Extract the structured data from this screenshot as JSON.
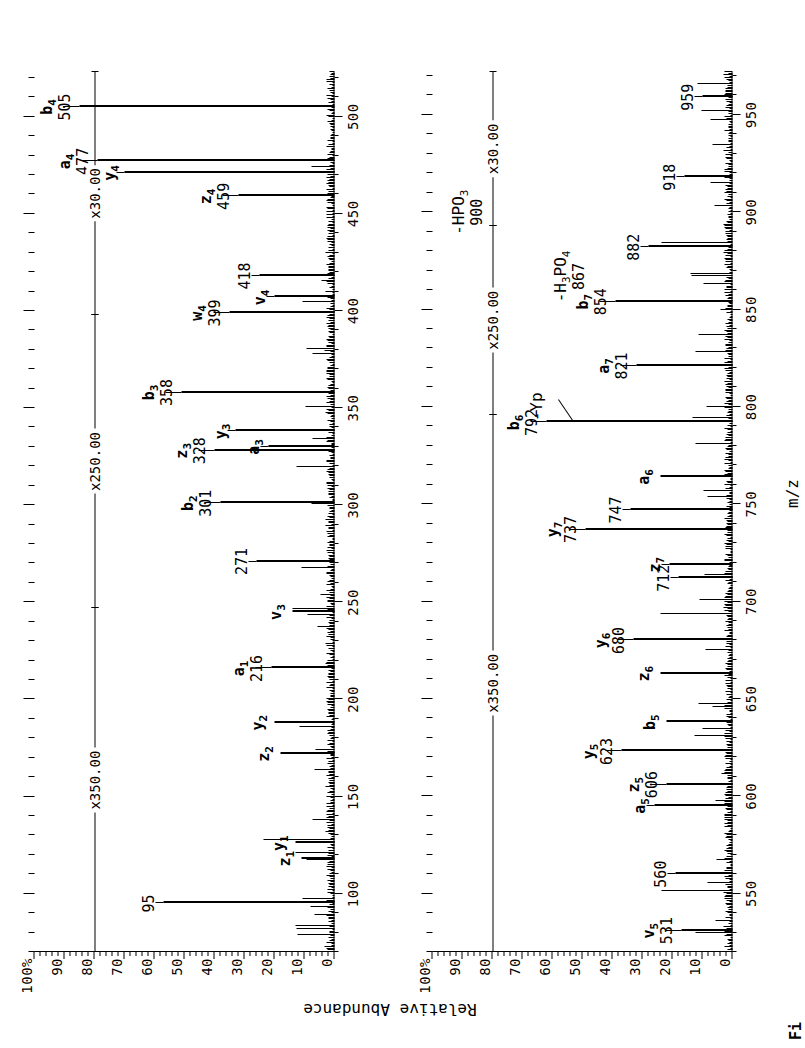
{
  "figure": {
    "caption": "Fi",
    "y_axis_label": "Relative Abundance",
    "x_axis_label": "m/z",
    "y_ticks": [
      "0",
      "10",
      "20",
      "30",
      "40",
      "50",
      "60",
      "70",
      "80",
      "90",
      "100"
    ],
    "y_percent_suffix": "%"
  },
  "chart_data": {
    "type": "line",
    "title": "",
    "xlabel": "m/z",
    "ylabel": "Relative Abundance",
    "panels": [
      {
        "name": "upper-spectrum",
        "xlim": [
          70,
          523
        ],
        "ylim": [
          0,
          100
        ],
        "x_ticks": [
          100,
          150,
          200,
          250,
          300,
          350,
          400,
          450,
          500
        ],
        "y_ticks": [
          0,
          10,
          20,
          30,
          40,
          50,
          60,
          70,
          80,
          90,
          100
        ],
        "magnifications": [
          {
            "label": "x350.00",
            "from": 70,
            "to": 247
          },
          {
            "label": "x250.00",
            "from": 247,
            "to": 398
          },
          {
            "label": "x30.00",
            "from": 398,
            "to": 523
          }
        ],
        "labeled_peaks": [
          {
            "ion": "z",
            "sub": "1",
            "mz": "",
            "x": 118,
            "y": 11,
            "leader": "none"
          },
          {
            "ion": "y",
            "sub": "1",
            "mz": "",
            "x": 126,
            "y": 13,
            "leader": "none"
          },
          {
            "ion": "",
            "sub": "",
            "mz": "95",
            "x": 95,
            "y": 57,
            "leader": "left"
          },
          {
            "ion": "z",
            "sub": "2",
            "mz": "",
            "x": 172,
            "y": 18,
            "leader": "none"
          },
          {
            "ion": "y",
            "sub": "2",
            "mz": "",
            "x": 188,
            "y": 20,
            "leader": "none"
          },
          {
            "ion": "a",
            "sub": "1",
            "mz": "216",
            "x": 216,
            "y": 21,
            "leader": "left"
          },
          {
            "ion": "v",
            "sub": "3",
            "mz": "",
            "x": 245,
            "y": 14,
            "leader": "none"
          },
          {
            "ion": "",
            "sub": "",
            "mz": "271",
            "x": 271,
            "y": 26,
            "leader": "left"
          },
          {
            "ion": "b",
            "sub": "2",
            "mz": "301",
            "x": 301,
            "y": 38,
            "leader": "left"
          },
          {
            "ion": "z",
            "sub": "3",
            "mz": "328",
            "x": 328,
            "y": 40,
            "leader": "left"
          },
          {
            "ion": "y",
            "sub": "3",
            "mz": "",
            "x": 338,
            "y": 33,
            "leader": "left"
          },
          {
            "ion": "a",
            "sub": "3",
            "mz": "",
            "x": 330,
            "y": 22,
            "leader": "diag"
          },
          {
            "ion": "b",
            "sub": "3",
            "mz": "358",
            "x": 358,
            "y": 51,
            "leader": "left"
          },
          {
            "ion": "w",
            "sub": "4",
            "mz": "399",
            "x": 399,
            "y": 35,
            "leader": "left"
          },
          {
            "ion": "v",
            "sub": "4",
            "mz": "",
            "x": 407,
            "y": 20,
            "leader": "diag"
          },
          {
            "ion": "",
            "sub": "",
            "mz": "418",
            "x": 418,
            "y": 25,
            "leader": "left"
          },
          {
            "ion": "z",
            "sub": "4",
            "mz": "459",
            "x": 459,
            "y": 32,
            "leader": "left"
          },
          {
            "ion": "y",
            "sub": "4",
            "mz": "",
            "x": 471,
            "y": 70,
            "leader": "diag"
          },
          {
            "ion": "a",
            "sub": "4",
            "mz": "477",
            "x": 477,
            "y": 79,
            "leader": "left"
          },
          {
            "ion": "b",
            "sub": "4",
            "mz": "505",
            "x": 505,
            "y": 85,
            "leader": "left"
          }
        ]
      },
      {
        "name": "lower-spectrum",
        "xlim": [
          520,
          972
        ],
        "ylim": [
          0,
          100
        ],
        "x_ticks": [
          550,
          600,
          650,
          700,
          750,
          800,
          850,
          900,
          950
        ],
        "y_ticks": [
          0,
          10,
          20,
          30,
          40,
          50,
          60,
          70,
          80,
          90,
          100
        ],
        "magnifications": [
          {
            "label": "x350.00",
            "from": 520,
            "to": 796
          },
          {
            "label": "x250.00",
            "from": 796,
            "to": 893
          },
          {
            "label": "x30.00",
            "from": 893,
            "to": 972
          }
        ],
        "labeled_peaks": [
          {
            "ion": "v",
            "sub": "5",
            "mz": "531",
            "x": 531,
            "y": 17,
            "leader": "left"
          },
          {
            "ion": "",
            "sub": "",
            "mz": "560",
            "x": 560,
            "y": 19,
            "leader": "left"
          },
          {
            "ion": "a",
            "sub": "5",
            "mz": "",
            "x": 595,
            "y": 26,
            "leader": "diag"
          },
          {
            "ion": "z",
            "sub": "5",
            "mz": "606",
            "x": 606,
            "y": 22,
            "leader": "diag"
          },
          {
            "ion": "y",
            "sub": "5",
            "mz": "623",
            "x": 623,
            "y": 37,
            "leader": "left"
          },
          {
            "ion": "b",
            "sub": "5",
            "mz": "",
            "x": 638,
            "y": 22,
            "leader": "none"
          },
          {
            "ion": "z",
            "sub": "6",
            "mz": "",
            "x": 663,
            "y": 24,
            "leader": "none"
          },
          {
            "ion": "y",
            "sub": "6",
            "mz": "680",
            "x": 680,
            "y": 33,
            "leader": "left"
          },
          {
            "ion": "z",
            "sub": "7",
            "mz": "",
            "x": 719,
            "y": 21,
            "leader": "diag"
          },
          {
            "ion": "",
            "sub": "",
            "mz": "712",
            "x": 712,
            "y": 18,
            "leader": "left"
          },
          {
            "ion": "y",
            "sub": "7",
            "mz": "737",
            "x": 737,
            "y": 49,
            "leader": "left"
          },
          {
            "ion": "",
            "sub": "",
            "mz": "747",
            "x": 747,
            "y": 34,
            "leader": "left"
          },
          {
            "ion": "a",
            "sub": "6",
            "mz": "",
            "x": 764,
            "y": 24,
            "leader": "none"
          },
          {
            "ion": "b",
            "sub": "6",
            "mz": "792",
            "x": 792,
            "y": 62,
            "leader": "left"
          },
          {
            "ion": "a",
            "sub": "7",
            "mz": "821",
            "x": 821,
            "y": 32,
            "leader": "left"
          },
          {
            "ion": "b",
            "sub": "7",
            "mz": "854",
            "x": 854,
            "y": 39,
            "leader": "left"
          },
          {
            "ion": "",
            "sub": "",
            "mz": "882",
            "x": 882,
            "y": 28,
            "leader": "left"
          },
          {
            "ion": "",
            "sub": "",
            "mz": "918",
            "x": 918,
            "y": 16,
            "leader": "left"
          },
          {
            "ion": "",
            "sub": "",
            "mz": "959",
            "x": 959,
            "y": 10,
            "leader": "left"
          }
        ],
        "neutral_loss_labels": [
          {
            "text": "-HPO3",
            "mz": "900",
            "x": 900
          },
          {
            "text": "-H3PO4",
            "mz": "867",
            "x": 867
          },
          {
            "text": "-Yp",
            "mz": "",
            "x": 800
          }
        ]
      }
    ]
  },
  "annotations": {
    "hpo3": "-HPO",
    "hpo3_sub": "3",
    "h3po4_pre": "-H",
    "h3po4_sub1": "3",
    "h3po4_mid": "PO",
    "h3po4_sub2": "4",
    "yp": "-Yp"
  }
}
